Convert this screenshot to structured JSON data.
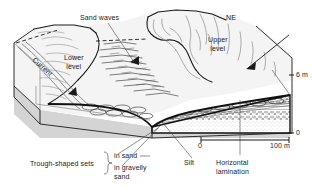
{
  "figure": {
    "type": "block-diagram",
    "background_color": "#ffffff",
    "line_color": "#1a1a1a",
    "block_face_color": "#d9d9d9",
    "surface_color": "#f2f2f2"
  },
  "labels": {
    "sand_waves": "Sand waves",
    "lower_level": "Lower\nlevel",
    "upper_level": "Upper\nlevel",
    "current": "Current",
    "ne": "NE",
    "silt": "Silt",
    "horizontal_lamination": "Horizontal\nlamination",
    "trough_shaped_sets": "Trough-shaped sets",
    "in_sand": "in sand",
    "in_gravelly_sand": "in gravelly\nsand"
  },
  "scales": {
    "vertical": {
      "top_label": "6 m",
      "bottom_label": "0",
      "units": "m",
      "range": [
        0,
        6
      ]
    },
    "horizontal": {
      "left_label": "0",
      "right_label": "100 m",
      "units": "m",
      "range": [
        0,
        100
      ]
    }
  },
  "arrows": {
    "current_direction": "down-left",
    "ne_direction": "down-left",
    "sand_wave_migration": "down-left"
  },
  "legend_brace": {
    "title": "Trough-shaped sets",
    "items": [
      "in sand",
      "in gravelly\nsand"
    ]
  }
}
